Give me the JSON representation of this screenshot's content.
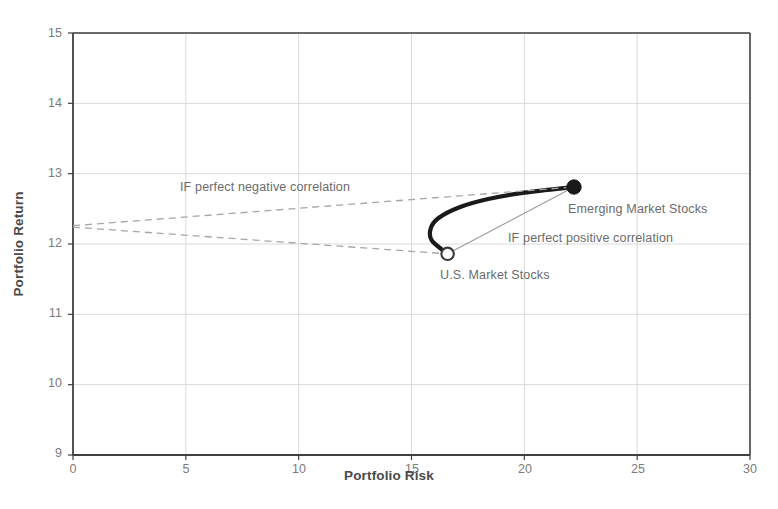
{
  "chart_data": {
    "type": "line",
    "title": "",
    "xlabel": "Portfolio Risk",
    "ylabel": "Portfolio Return",
    "xlim": [
      0,
      30
    ],
    "ylim": [
      9,
      15
    ],
    "xticks": [
      0,
      5,
      10,
      15,
      20,
      25,
      30
    ],
    "yticks": [
      9,
      10,
      11,
      12,
      13,
      14,
      15
    ],
    "xtick_labels": [
      "0",
      "5",
      "10",
      "15",
      "20",
      "25",
      "30"
    ],
    "ytick_labels": [
      "9",
      "10",
      "11",
      "12",
      "13",
      "14",
      "15"
    ],
    "grid": true,
    "legend": "none",
    "points": [
      {
        "name": "U.S. Market Stocks",
        "label": "U.S. Market Stocks",
        "x": 16.6,
        "y": 11.86,
        "marker": "open-circle"
      },
      {
        "name": "Emerging Market Stocks",
        "label": "Emerging Market Stocks",
        "x": 22.2,
        "y": 12.81,
        "marker": "filled-circle"
      }
    ],
    "series": [
      {
        "name": "efficient-frontier-curve",
        "style": "solid-thick-black",
        "points": [
          {
            "x": 16.6,
            "y": 11.86
          },
          {
            "x": 15.9,
            "y": 12.05
          },
          {
            "x": 15.85,
            "y": 12.22
          },
          {
            "x": 16.2,
            "y": 12.37
          },
          {
            "x": 17.1,
            "y": 12.52
          },
          {
            "x": 18.4,
            "y": 12.64
          },
          {
            "x": 20.0,
            "y": 12.73
          },
          {
            "x": 22.2,
            "y": 12.81
          }
        ]
      },
      {
        "name": "perfect-positive-correlation-line",
        "style": "solid-thin-gray",
        "points": [
          {
            "x": 16.6,
            "y": 11.86
          },
          {
            "x": 22.2,
            "y": 12.81
          }
        ]
      },
      {
        "name": "perfect-negative-correlation-upper",
        "style": "dashed-gray",
        "points": [
          {
            "x": 0.0,
            "y": 12.26
          },
          {
            "x": 22.2,
            "y": 12.81
          }
        ]
      },
      {
        "name": "perfect-negative-correlation-lower",
        "style": "dashed-gray",
        "points": [
          {
            "x": 0.0,
            "y": 12.24
          },
          {
            "x": 16.6,
            "y": 11.86
          }
        ]
      }
    ],
    "annotations": [
      {
        "name": "negative-correlation-annotation",
        "text": "IF perfect negative correlation",
        "x_px": 180,
        "y_px": 180
      },
      {
        "name": "positive-correlation-annotation",
        "text": "IF perfect positive correlation",
        "x_px": 508,
        "y_px": 231
      },
      {
        "name": "emerging-market-stocks-label",
        "text": "Emerging Market Stocks",
        "x_px": 568,
        "y_px": 202
      },
      {
        "name": "us-market-stocks-label",
        "text": "U.S. Market Stocks",
        "x_px": 440,
        "y_px": 268
      }
    ],
    "colors": {
      "curve": "#1a1a1a",
      "tangent_line": "#9a9a9a",
      "dashed_line": "#a6a6a6",
      "grid": "#d9d9d9",
      "axis": "#404040",
      "text": "#6b6b6b",
      "background": "#ffffff"
    }
  }
}
